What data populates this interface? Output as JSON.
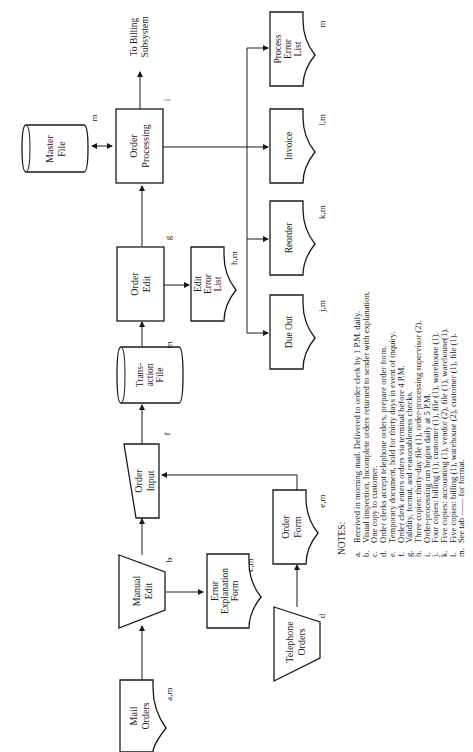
{
  "diagram": {
    "orientation": "rotated -90deg",
    "nodes": {
      "mail_orders": {
        "label": [
          "Mail",
          "Orders"
        ],
        "tag": "a,m",
        "shape": "document"
      },
      "manual_edit": {
        "label": [
          "Manual",
          "Edit"
        ],
        "tag": "b",
        "shape": "manual-operation"
      },
      "error_explanation_form": {
        "label": [
          "Error",
          "Explanation",
          "Form"
        ],
        "tag": "c,m",
        "shape": "document"
      },
      "telephone_orders": {
        "label": [
          "Telephone",
          "Orders"
        ],
        "tag": "d",
        "shape": "manual-operation"
      },
      "order_form": {
        "label": [
          "Order",
          "Form"
        ],
        "tag": "e,m",
        "shape": "document"
      },
      "order_input": {
        "label": [
          "Order",
          "Input"
        ],
        "tag": "f",
        "shape": "manual-input"
      },
      "transaction_file": {
        "label": [
          "Trans-",
          "action",
          "File"
        ],
        "tag": "m",
        "shape": "storage"
      },
      "order_edit": {
        "label": [
          "Order",
          "Edit"
        ],
        "tag": "g",
        "shape": "process"
      },
      "edit_error_list": {
        "label": [
          "Edit",
          "Error",
          "List"
        ],
        "tag": "h,m",
        "shape": "document"
      },
      "order_processing": {
        "label": [
          "Order",
          "Processing"
        ],
        "tag": "i",
        "shape": "process"
      },
      "master_file": {
        "label": [
          "Master",
          "File"
        ],
        "tag": "m",
        "shape": "storage"
      },
      "to_billing": {
        "label": [
          "To Billing",
          "Subsystem"
        ]
      },
      "due_out": {
        "label": [
          "Due Out"
        ],
        "tag": "j,m",
        "shape": "document"
      },
      "reorder": {
        "label": [
          "Reorder"
        ],
        "tag": "k,m",
        "shape": "document"
      },
      "invoice": {
        "label": [
          "Invoice"
        ],
        "tag": "l,m",
        "shape": "document"
      },
      "process_error_list": {
        "label": [
          "Process",
          "Error",
          "List"
        ],
        "tag": "m",
        "shape": "document"
      }
    },
    "edges": [
      [
        "mail_orders",
        "manual_edit"
      ],
      [
        "manual_edit",
        "error_explanation_form"
      ],
      [
        "manual_edit",
        "order_input"
      ],
      [
        "telephone_orders",
        "order_form"
      ],
      [
        "order_form",
        "order_input"
      ],
      [
        "order_input",
        "transaction_file"
      ],
      [
        "transaction_file",
        "order_edit"
      ],
      [
        "order_edit",
        "edit_error_list"
      ],
      [
        "order_edit",
        "order_processing"
      ],
      [
        "master_file",
        "order_processing",
        "bidirectional"
      ],
      [
        "order_processing",
        "to_billing"
      ],
      [
        "order_processing",
        "invoice"
      ],
      [
        "order_processing",
        "process_error_list"
      ],
      [
        "order_processing",
        "reorder"
      ],
      [
        "order_processing",
        "due_out"
      ]
    ]
  },
  "notes": {
    "title": "NOTES:",
    "items": [
      {
        "key": "a.",
        "text": "Received in morning mail. Delivered to order clerk by 1 P.M. daily."
      },
      {
        "key": "b.",
        "text": "Visual inspection. Incomplete orders returned to sender with explanation."
      },
      {
        "key": "c.",
        "text": "One copy to customer."
      },
      {
        "key": "d.",
        "text": "Order clerks accept telephone orders, prepare order form."
      },
      {
        "key": "e.",
        "text": "Temporary document, hold for thirty days in event of inquiry."
      },
      {
        "key": "f.",
        "text": "Order clerk enters orders via terminal before 4 P.M."
      },
      {
        "key": "g.",
        "text": "Validity, format, and reasonableness checks."
      },
      {
        "key": "h.",
        "text": "Three copies: thirty-day file (1), order-processing supervisor (2)."
      },
      {
        "key": "i.",
        "text": "Order-processing run begins daily at 5 P.M."
      },
      {
        "key": "j.",
        "text": "Four copies: billing (1), customer (1), file (1), warehouse (1)."
      },
      {
        "key": "k.",
        "text": "Five copies: accounting (1), vendor (2), file (1), warehouse(1)."
      },
      {
        "key": "l.",
        "text": "Five copies: billing (1), warehouse (2), customer (1), file (1)."
      },
      {
        "key": "m.",
        "text": "See tab —— for format."
      }
    ]
  }
}
